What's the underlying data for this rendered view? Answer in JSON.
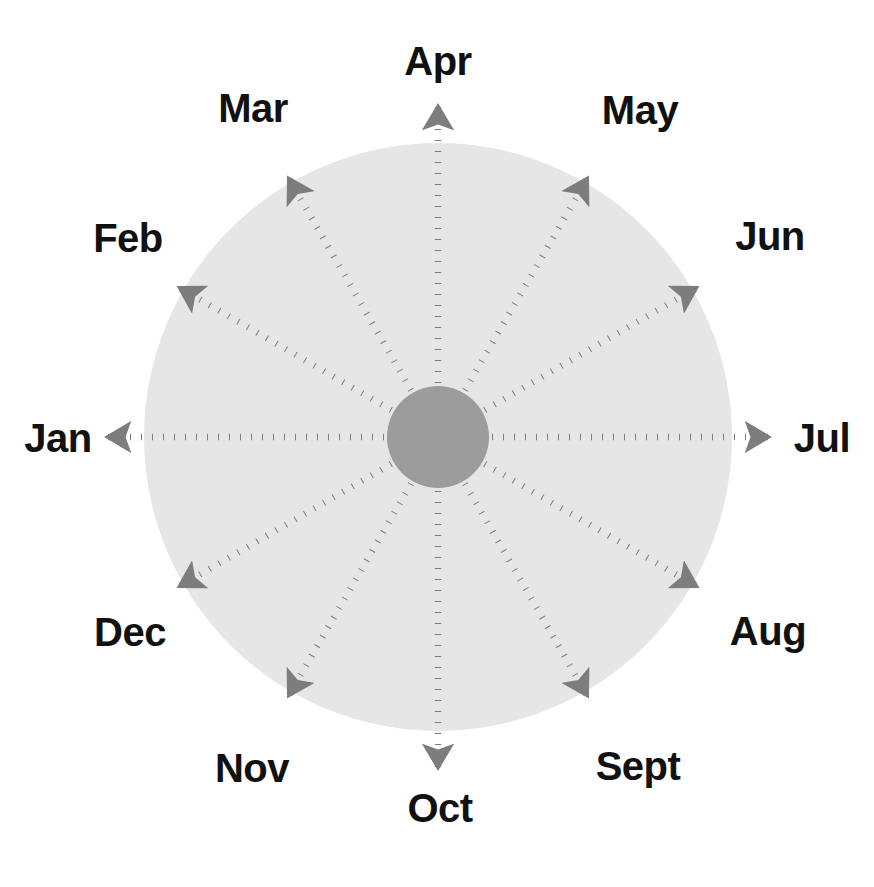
{
  "figure": {
    "background_color": "#ffffff",
    "outer_disc_color": "#e6e6e6",
    "inner_hub_color": "#9c9c9c",
    "spoke_color": "#7d7d7d",
    "label_color": "#111111",
    "center_x": 438,
    "center_y": 437,
    "outer_radius": 294,
    "inner_radius": 51,
    "spoke_count": 12
  },
  "chart_data": {
    "type": "pie",
    "subtitle": "",
    "xlabel": "",
    "ylabel": "",
    "legend_position": "none",
    "grid": false,
    "categories": [
      "Jan",
      "Feb",
      "Mar",
      "Apr",
      "May",
      "Jun",
      "Jul",
      "Aug",
      "Sept",
      "Oct",
      "Nov",
      "Dec"
    ],
    "values": [
      1,
      1,
      1,
      1,
      1,
      1,
      1,
      1,
      1,
      1,
      1,
      1
    ],
    "annotations": [
      "Apr at top (0 deg)",
      "Jul at right (90 deg)",
      "Oct at bottom (180 deg)",
      "Jan at left (270 deg)"
    ],
    "spokes": [
      {
        "label": "Apr",
        "angle_deg": 0,
        "label_x": 438,
        "label_y": 75,
        "anchor": "middle",
        "arrow_extends_beyond_disc": true
      },
      {
        "label": "May",
        "angle_deg": 30,
        "label_x": 640,
        "label_y": 124,
        "anchor": "middle",
        "arrow_extends_beyond_disc": false
      },
      {
        "label": "Jun",
        "angle_deg": 60,
        "label_x": 770,
        "label_y": 250,
        "anchor": "middle",
        "arrow_extends_beyond_disc": false
      },
      {
        "label": "Jul",
        "angle_deg": 90,
        "label_x": 822,
        "label_y": 452,
        "anchor": "middle",
        "arrow_extends_beyond_disc": true
      },
      {
        "label": "Aug",
        "angle_deg": 120,
        "label_x": 768,
        "label_y": 645,
        "anchor": "middle",
        "arrow_extends_beyond_disc": false
      },
      {
        "label": "Sept",
        "angle_deg": 150,
        "label_x": 638,
        "label_y": 780,
        "anchor": "middle",
        "arrow_extends_beyond_disc": false
      },
      {
        "label": "Oct",
        "angle_deg": 180,
        "label_x": 440,
        "label_y": 822,
        "anchor": "middle",
        "arrow_extends_beyond_disc": true
      },
      {
        "label": "Nov",
        "angle_deg": 210,
        "label_x": 252,
        "label_y": 782,
        "anchor": "middle",
        "arrow_extends_beyond_disc": false
      },
      {
        "label": "Dec",
        "angle_deg": 240,
        "label_x": 130,
        "label_y": 646,
        "anchor": "middle",
        "arrow_extends_beyond_disc": false
      },
      {
        "label": "Jan",
        "angle_deg": 270,
        "label_x": 58,
        "label_y": 452,
        "anchor": "middle",
        "arrow_extends_beyond_disc": true
      },
      {
        "label": "Feb",
        "angle_deg": 300,
        "label_x": 128,
        "label_y": 252,
        "anchor": "middle",
        "arrow_extends_beyond_disc": false
      },
      {
        "label": "Mar",
        "angle_deg": 330,
        "label_x": 253,
        "label_y": 122,
        "anchor": "middle",
        "arrow_extends_beyond_disc": false
      }
    ]
  }
}
